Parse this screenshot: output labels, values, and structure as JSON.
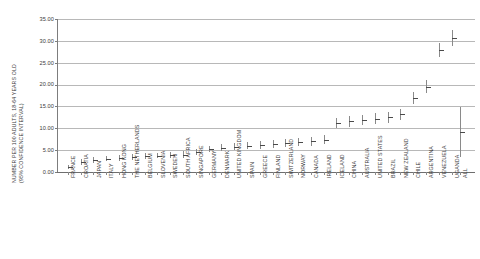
{
  "chart_data": {
    "type": "scatter",
    "title": "",
    "xlabel": "",
    "ylabel": "NUMBER PER 100 ADULTS, 18-64 YEARS OLD",
    "ylabel_line2": "(95% CONFIDENCE INTERVAL)",
    "ylim": [
      0.0,
      35.0
    ],
    "ytick_labels": [
      "35.00",
      "30.00",
      "25.00",
      "20.00",
      "15.00",
      "10.00",
      "5.00",
      "0.00"
    ],
    "ytick_values": [
      35,
      30,
      25,
      20,
      15,
      10,
      5,
      0
    ],
    "grid": true,
    "legend": "none",
    "categories": [
      "FRANCE",
      "CROATIA",
      "JAPAN",
      "ITALY",
      "HONG KONG",
      "THE NETHERLANDS",
      "BELGIUM",
      "SLOVENIA",
      "SWEDEN",
      "SOUTH AFRICA",
      "SINGAPORE",
      "GERMANY",
      "DENMARK",
      "UNITED KINGDOM",
      "SPAIN",
      "GREECE",
      "FINLAND",
      "SWITZERLAND",
      "NORWAY",
      "CANADA",
      "IRELAND",
      "ICELAND",
      "CHINA",
      "AUSTRALIA",
      "UNITED STATES",
      "BRAZIL",
      "NEW ZEALAND",
      "CHILE",
      "ARGENTINA",
      "VENEZUELA",
      "UGANDA",
      "ALL"
    ],
    "values": [
      1.1,
      2.3,
      2.7,
      3.0,
      3.2,
      3.4,
      3.6,
      3.7,
      3.8,
      4.0,
      4.5,
      5.2,
      5.6,
      5.8,
      6.0,
      6.2,
      6.4,
      6.6,
      6.8,
      7.0,
      7.4,
      11.2,
      11.6,
      11.9,
      12.2,
      12.5,
      13.2,
      17.0,
      19.5,
      28.0,
      30.6,
      9.2
    ],
    "ci_low": [
      0.6,
      1.7,
      2.1,
      2.4,
      2.6,
      2.8,
      3.0,
      3.1,
      3.2,
      3.3,
      3.8,
      4.5,
      4.8,
      5.0,
      5.2,
      5.3,
      5.5,
      5.7,
      5.9,
      6.0,
      6.4,
      10.0,
      10.4,
      10.7,
      11.0,
      11.2,
      12.0,
      15.6,
      18.0,
      26.4,
      28.8,
      3.5
    ],
    "ci_high": [
      1.7,
      3.0,
      3.4,
      3.7,
      3.9,
      4.1,
      4.3,
      4.4,
      4.5,
      4.7,
      5.2,
      6.0,
      6.4,
      6.6,
      6.8,
      7.0,
      7.3,
      7.5,
      7.7,
      8.0,
      8.4,
      12.4,
      12.8,
      13.1,
      13.4,
      13.8,
      14.4,
      18.4,
      21.0,
      29.6,
      32.4,
      14.9
    ]
  }
}
